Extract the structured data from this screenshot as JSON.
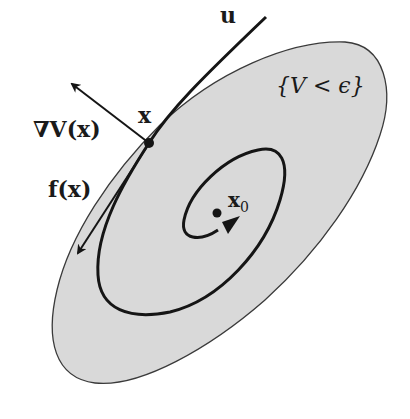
{
  "figure": {
    "colors": {
      "region_fill": "#d9d9d9",
      "region_stroke": "#3a3a3a",
      "curve": "#151515",
      "background": "#ffffff"
    },
    "labels": {
      "u": "u",
      "x": "x",
      "grad_v": "∇V(x)",
      "f_x": "f(x)",
      "x0_base": "x",
      "x0_sub": "0",
      "region": "{V < ϵ}"
    },
    "elements": {
      "region": "sublevel set {V < ϵ}, tilted ellipse-like blob",
      "trajectory": "spiral from x converging to x0",
      "control_curve": "curve u emanating from x tangent to region boundary",
      "gradient_arrow": "∇V(x), outward normal at x",
      "vector_field_arrow": "f(x), tangent pointing into region",
      "equilibrium": "x0"
    }
  }
}
